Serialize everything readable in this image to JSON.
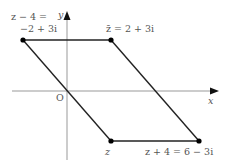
{
  "diagram": {
    "type": "complex-plane-parallelogram",
    "axes": {
      "x_label": "x",
      "y_label": "y",
      "origin_label": "O"
    },
    "vertices": [
      {
        "id": "z_minus_4",
        "label_line1": "z − 4 =",
        "label_line2": "−2 + 3i",
        "value": "-2 + 3i"
      },
      {
        "id": "z_bar",
        "label": "z̄ = 2 + 3i",
        "value": "2 + 3i"
      },
      {
        "id": "z",
        "label": "z",
        "value": "2 - 3i"
      },
      {
        "id": "z_plus_4",
        "label": "z + 4 = 6 − 3i",
        "value": "6 - 3i"
      }
    ],
    "colors": {
      "axis": "#888888",
      "edge": "#222222",
      "point": "#000000",
      "text": "#555555"
    }
  }
}
